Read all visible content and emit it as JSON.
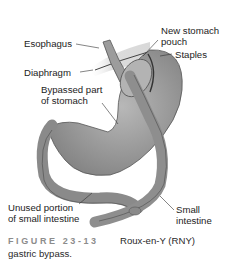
{
  "labels": {
    "esophagus": "Esophagus",
    "new_stomach_pouch_1": "New stomach",
    "new_stomach_pouch_2": "pouch",
    "staples": "Staples",
    "diaphragm": "Diaphragm",
    "bypassed_1": "Bypassed part",
    "bypassed_2": "of stomach",
    "unused_1": "Unused portion",
    "unused_2": "of small intestine",
    "small_int_1": "Small",
    "small_int_2": "intestine"
  },
  "caption": {
    "figure_number": "FIGURE 23-13",
    "title_line1": "Roux-en-Y (RNY)",
    "title_line2": "gastric bypass."
  },
  "colors": {
    "organ_fill": "#9a9a9a",
    "organ_dark": "#6f6f6f",
    "caption_label": "#8c8c8c"
  }
}
